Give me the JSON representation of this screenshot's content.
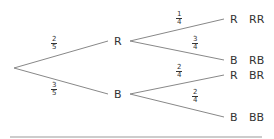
{
  "diagram": {
    "type": "probability-tree",
    "root_branches": [
      {
        "label": "R",
        "probability": {
          "num": "2",
          "den": "5"
        }
      },
      {
        "label": "B",
        "probability": {
          "num": "3",
          "den": "5"
        }
      }
    ],
    "second_level": [
      {
        "parent": "R",
        "label": "R",
        "probability": {
          "num": "1",
          "den": "4"
        },
        "outcome": "RR"
      },
      {
        "parent": "R",
        "label": "B",
        "probability": {
          "num": "3",
          "den": "4"
        },
        "outcome": "RB"
      },
      {
        "parent": "B",
        "label": "R",
        "probability": {
          "num": "2",
          "den": "4"
        },
        "outcome": "BR"
      },
      {
        "parent": "B",
        "label": "B",
        "probability": {
          "num": "2",
          "den": "4"
        },
        "outcome": "BB"
      }
    ],
    "line_color": "#888888"
  }
}
